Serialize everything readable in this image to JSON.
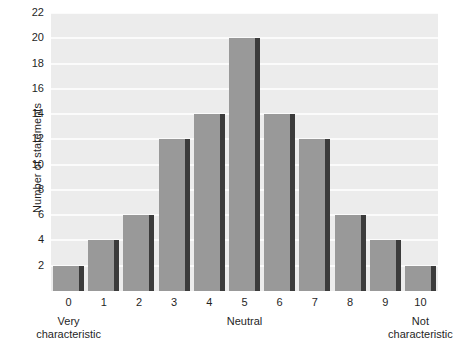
{
  "chart_data": {
    "type": "bar",
    "title": "",
    "subtitle": "",
    "xlabel": "",
    "ylabel": "Number of statements",
    "categories": [
      "0",
      "1",
      "2",
      "3",
      "4",
      "5",
      "6",
      "7",
      "8",
      "9",
      "10"
    ],
    "values": [
      2,
      4,
      6,
      12,
      14,
      20,
      14,
      12,
      6,
      4,
      2
    ],
    "series": [
      {
        "name": "Number of statements",
        "values": [
          2,
          4,
          6,
          12,
          14,
          20,
          14,
          12,
          6,
          4,
          2
        ]
      }
    ],
    "ylim": [
      0,
      22
    ],
    "xlim": [
      -0.5,
      10.5
    ],
    "yticks": [
      2,
      4,
      6,
      8,
      10,
      12,
      14,
      16,
      18,
      20,
      22
    ],
    "ytick_labels": [
      "2",
      "4",
      "6",
      "8",
      "10",
      "12",
      "14",
      "16",
      "18",
      "20",
      "22"
    ],
    "xtick_labels": [
      "0",
      "1",
      "2",
      "3",
      "4",
      "5",
      "6",
      "7",
      "8",
      "9",
      "10"
    ],
    "grid": "horizontal",
    "legend": "none",
    "annotations": [
      {
        "text": "Very\ncharacteristic",
        "at_category": "0",
        "position": "below-axis"
      },
      {
        "text": "Neutral",
        "at_category": "5",
        "position": "below-axis"
      },
      {
        "text": "Not\ncharacteristic",
        "at_category": "10",
        "position": "below-axis"
      }
    ],
    "colors": {
      "bar_fill": "#999999",
      "bar_shadow": "#3b3b3b",
      "plot_background": "#ececec",
      "gridline": "#fbfbfb",
      "figure_background": "#ffffff",
      "text": "#1f1f1f"
    }
  },
  "axis": {
    "y_title": "Number of statements"
  },
  "anchors": {
    "left": "Very\ncharacteristic",
    "middle": "Neutral",
    "right": "Not\ncharacteristic"
  }
}
